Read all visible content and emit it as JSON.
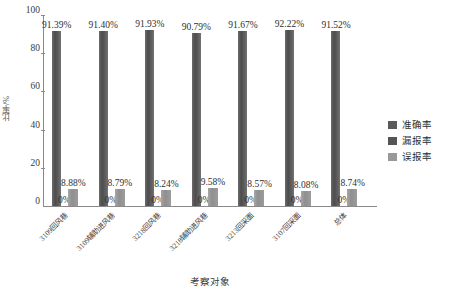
{
  "chart_data": {
    "type": "bar",
    "title": "",
    "xlabel": "考察对象",
    "ylabel": "比率/%",
    "ylim": [
      0,
      100
    ],
    "yticks": [
      0,
      20,
      40,
      60,
      80,
      100
    ],
    "ytick_labels": [
      "0",
      "20",
      "40",
      "60",
      "80",
      "100"
    ],
    "grid": false,
    "legend_position": "right",
    "categories": [
      "3109回风巷",
      "3109辅助进风巷",
      "3218回风巷",
      "3218辅助进风巷",
      "3213回采面",
      "3107回采面",
      "总体"
    ],
    "series": [
      {
        "name": "准确率",
        "color": "#5a5a5a",
        "values": [
          91.39,
          91.4,
          91.93,
          90.79,
          91.67,
          92.22,
          91.52
        ],
        "labels": [
          "91.39%",
          "91.40%",
          "91.93%",
          "90.79%",
          "91.67%",
          "92.22%",
          "91.52%"
        ]
      },
      {
        "name": "漏报率",
        "color": "#555555",
        "values": [
          0,
          0,
          0,
          0,
          0,
          0,
          0
        ],
        "labels": [
          "0%",
          "0%",
          "0%",
          "0%",
          "0%",
          "0%",
          "0%"
        ]
      },
      {
        "name": "误报率",
        "color": "#999999",
        "values": [
          8.88,
          8.79,
          8.24,
          9.58,
          8.57,
          8.08,
          8.74
        ],
        "labels": [
          "8.88%",
          "8.79%",
          "8.24%",
          "9.58%",
          "8.57%",
          "8.08%",
          "8.74%"
        ]
      }
    ]
  }
}
